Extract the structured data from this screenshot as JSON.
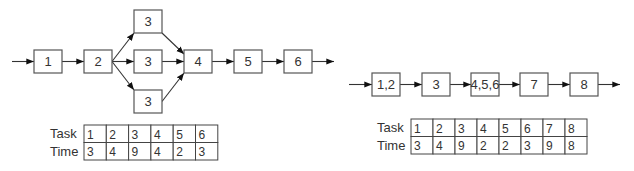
{
  "diagrams": [
    {
      "name": "original-network",
      "nodes": [
        {
          "id": "n1",
          "label": "1"
        },
        {
          "id": "n2",
          "label": "2"
        },
        {
          "id": "n3a",
          "label": "3"
        },
        {
          "id": "n3b",
          "label": "3"
        },
        {
          "id": "n3c",
          "label": "3"
        },
        {
          "id": "n4",
          "label": "4"
        },
        {
          "id": "n5",
          "label": "5"
        },
        {
          "id": "n6",
          "label": "6"
        }
      ],
      "edges": [
        [
          "in",
          "n1"
        ],
        [
          "n1",
          "n2"
        ],
        [
          "n2",
          "n3a"
        ],
        [
          "n2",
          "n3b"
        ],
        [
          "n2",
          "n3c"
        ],
        [
          "n3a",
          "n4"
        ],
        [
          "n3b",
          "n4"
        ],
        [
          "n3c",
          "n4"
        ],
        [
          "n4",
          "n5"
        ],
        [
          "n5",
          "n6"
        ],
        [
          "n6",
          "out"
        ]
      ],
      "table": {
        "row_labels": [
          "Task",
          "Time"
        ],
        "tasks": [
          "1",
          "2",
          "3",
          "4",
          "5",
          "6"
        ],
        "times": [
          "3",
          "4",
          "9",
          "4",
          "2",
          "3"
        ]
      }
    },
    {
      "name": "merged-network",
      "nodes": [
        {
          "id": "m1",
          "label": "1,2"
        },
        {
          "id": "m2",
          "label": "3"
        },
        {
          "id": "m3",
          "label": "4,5,6"
        },
        {
          "id": "m4",
          "label": "7"
        },
        {
          "id": "m5",
          "label": "8"
        }
      ],
      "edges": [
        [
          "in",
          "m1"
        ],
        [
          "m1",
          "m2"
        ],
        [
          "m2",
          "m3"
        ],
        [
          "m3",
          "m4"
        ],
        [
          "m4",
          "m5"
        ],
        [
          "m5",
          "out"
        ]
      ],
      "table": {
        "row_labels": [
          "Task",
          "Time"
        ],
        "tasks": [
          "1",
          "2",
          "3",
          "4",
          "5",
          "6",
          "7",
          "8"
        ],
        "times": [
          "3",
          "4",
          "9",
          "2",
          "2",
          "3",
          "9",
          "8"
        ]
      }
    }
  ]
}
